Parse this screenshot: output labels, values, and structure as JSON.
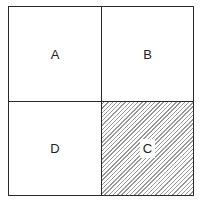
{
  "diagram": {
    "cells": [
      {
        "label": "A",
        "position": "top-left",
        "hatched": false
      },
      {
        "label": "B",
        "position": "top-right",
        "hatched": false
      },
      {
        "label": "D",
        "position": "bottom-left",
        "hatched": false
      },
      {
        "label": "C",
        "position": "bottom-right",
        "hatched": true
      }
    ],
    "colors": {
      "line": "#2a2a2a",
      "hatch": "#9a9a9a",
      "background": "#ffffff"
    }
  }
}
